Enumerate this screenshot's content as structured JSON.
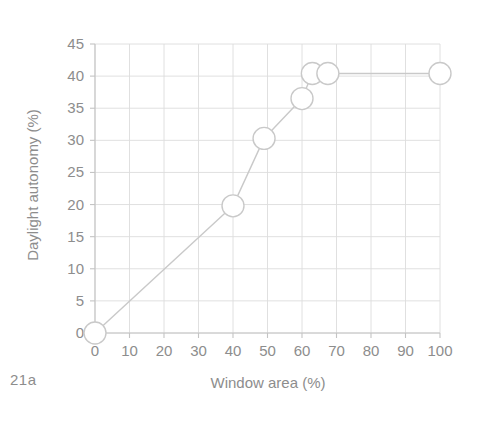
{
  "figure": {
    "caption": "21a"
  },
  "chart_data": {
    "type": "line",
    "title": "",
    "xlabel": "Window area (%)",
    "ylabel": "Daylight autonomy (%)",
    "xlim": [
      0,
      100
    ],
    "ylim": [
      0,
      45
    ],
    "xticks": [
      "0",
      "10",
      "20",
      "30",
      "40",
      "50",
      "60",
      "70",
      "80",
      "90",
      "100"
    ],
    "yticks": [
      "0",
      "5",
      "10",
      "15",
      "20",
      "25",
      "30",
      "35",
      "40",
      "45"
    ],
    "grid": true,
    "legend": "none",
    "marker": "open-circle",
    "line_color": "#c9c9c9",
    "marker_color": "#c9c9c9",
    "grid_color": "#dcdcdc",
    "axis_color": "#c4c4c4",
    "text_color": "#8d8d8d",
    "series": [
      {
        "name": "Daylight autonomy",
        "x": [
          0,
          40,
          49,
          60,
          63,
          67.5,
          100
        ],
        "y": [
          0,
          19.8,
          30.3,
          36.5,
          40.4,
          40.4,
          40.4
        ]
      }
    ]
  }
}
